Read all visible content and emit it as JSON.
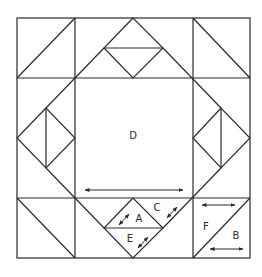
{
  "diagram": {
    "colors": {
      "line": "#2a2a2a",
      "background": "#ffffff"
    },
    "labels": [
      {
        "id": "D",
        "text": "D",
        "x": 133,
        "y": 139
      },
      {
        "id": "A",
        "text": "A",
        "x": 139,
        "y": 221
      },
      {
        "id": "C",
        "text": "C",
        "x": 157,
        "y": 210
      },
      {
        "id": "E",
        "text": "E",
        "x": 130,
        "y": 241
      },
      {
        "id": "F",
        "text": "F",
        "x": 206,
        "y": 229
      },
      {
        "id": "B",
        "text": "B",
        "x": 236,
        "y": 238
      }
    ],
    "grid": {
      "x": [
        17,
        75,
        193,
        250
      ],
      "y": [
        18,
        78,
        198,
        258
      ]
    },
    "pieces": [
      "A",
      "B",
      "C",
      "D",
      "E",
      "F"
    ],
    "grain_arrows": [
      {
        "piece": "D",
        "direction": "horizontal"
      },
      {
        "piece": "A",
        "direction": "diagonal"
      },
      {
        "piece": "C",
        "direction": "diagonal"
      },
      {
        "piece": "E",
        "direction": "diagonal"
      },
      {
        "piece": "F",
        "direction": "horizontal"
      },
      {
        "piece": "B",
        "direction": "horizontal"
      }
    ]
  }
}
